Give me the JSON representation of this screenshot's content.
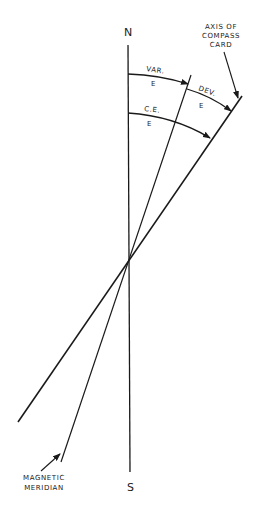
{
  "diagram": {
    "labels": {
      "north": "N",
      "south": "S",
      "axis_line1": "AXIS OF",
      "axis_line2": "COMPASS",
      "axis_line3": "CARD",
      "var": "VAR.",
      "var_dir": "E",
      "dev": "DEV.",
      "dev_dir": "E",
      "ce": "C.E.",
      "ce_dir": "E",
      "mag_line1": "MAGNETIC",
      "mag_line2": "MERIDIAN"
    },
    "lines": [
      {
        "name": "true-meridian",
        "from": [
          128,
          45
        ],
        "to": [
          130,
          472
        ]
      },
      {
        "name": "magnetic-meridian",
        "from": [
          191,
          75
        ],
        "to": [
          61,
          462
        ]
      },
      {
        "name": "compass-card-axis",
        "from": [
          242,
          96
        ],
        "to": [
          18,
          422
        ]
      }
    ],
    "arcs": [
      {
        "name": "variation-arc",
        "label": "VAR. E",
        "from": [
          128,
          74
        ],
        "to": [
          188,
          84
        ]
      },
      {
        "name": "deviation-arc",
        "label": "DEV. E",
        "from": [
          187,
          89
        ],
        "to": [
          231,
          111
        ]
      },
      {
        "name": "compass-error-arc",
        "label": "C.E. E",
        "from": [
          128,
          113
        ],
        "to": [
          210,
          138
        ]
      }
    ],
    "colors": {
      "ink": "#1a1a1a",
      "background": "#ffffff"
    }
  }
}
